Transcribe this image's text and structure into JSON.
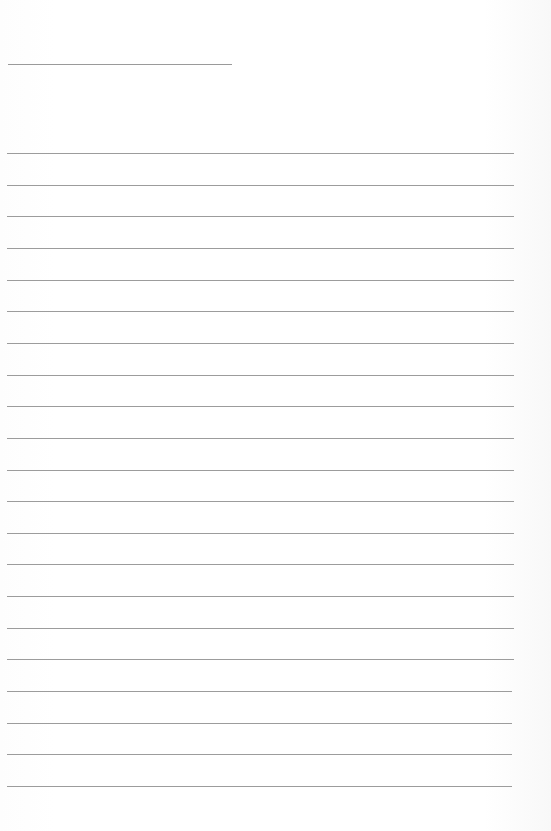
{
  "page": {
    "type": "lined-note-page",
    "title": "",
    "lines": [
      "",
      "",
      "",
      "",
      "",
      "",
      "",
      "",
      "",
      "",
      "",
      "",
      "",
      "",
      "",
      "",
      "",
      "",
      "",
      "",
      ""
    ],
    "line_count": 21,
    "line_color": "#9c9c9c",
    "background": "#ffffff"
  }
}
